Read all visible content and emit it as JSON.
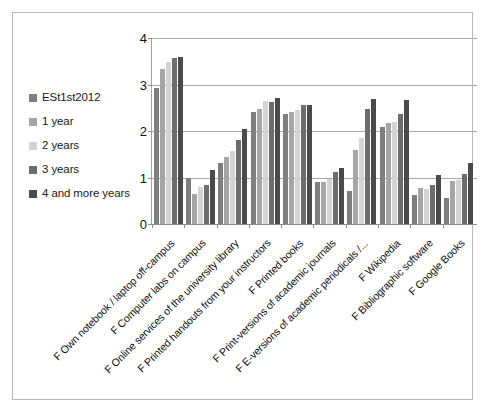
{
  "chart_data": {
    "type": "bar",
    "title": "",
    "subtitle": "",
    "xlabel": "",
    "ylabel": "",
    "ylim": [
      0,
      4
    ],
    "yticks": [
      0,
      1,
      2,
      3,
      4
    ],
    "ytick_labels": [
      "0",
      "1",
      "2",
      "3",
      "4"
    ],
    "grid": true,
    "legend_position": "left",
    "orientation": "vertical",
    "categories": [
      "F Own notebook / laptop off-campus",
      "F Computer labs on campus",
      "F Online services of the university library",
      "F Printed handouts from your instructors",
      "F Printed books",
      "F Print-versions of academic journals",
      "F E-versions of academic periodicals /...",
      "F Wikipedia",
      "F Bibliographic software",
      "F Google Books"
    ],
    "series": [
      {
        "name": "ESt1st2012",
        "color": "#7f7f7f",
        "values": [
          2.92,
          1.0,
          1.32,
          2.41,
          2.37,
          0.9,
          0.7,
          2.08,
          0.62,
          0.55
        ]
      },
      {
        "name": "1 year",
        "color": "#a6a6a6",
        "values": [
          3.33,
          0.65,
          1.44,
          2.47,
          2.41,
          0.91,
          1.6,
          2.17,
          0.78,
          0.93
        ]
      },
      {
        "name": "2 years",
        "color": "#d4d4d4",
        "values": [
          3.48,
          0.8,
          1.57,
          2.64,
          2.45,
          0.97,
          1.85,
          2.2,
          0.75,
          0.95
        ]
      },
      {
        "name": "3 years",
        "color": "#6d6d6d",
        "values": [
          3.58,
          0.84,
          1.8,
          2.63,
          2.56,
          1.12,
          2.47,
          2.36,
          0.83,
          1.07
        ]
      },
      {
        "name": "4 and more years",
        "color": "#4a4a4a",
        "values": [
          3.6,
          1.16,
          2.05,
          2.7,
          2.57,
          1.21,
          2.68,
          2.67,
          1.05,
          1.31
        ]
      }
    ]
  },
  "legend": {
    "items": [
      {
        "label": "ESt1st2012",
        "color": "#7f7f7f"
      },
      {
        "label": "1 year",
        "color": "#a6a6a6"
      },
      {
        "label": "2 years",
        "color": "#d4d4d4"
      },
      {
        "label": "3 years",
        "color": "#6d6d6d"
      },
      {
        "label": "4 and more years",
        "color": "#4a4a4a"
      }
    ]
  },
  "frame": {
    "border_color": "#b7b7b7",
    "background": "#ffffff"
  }
}
